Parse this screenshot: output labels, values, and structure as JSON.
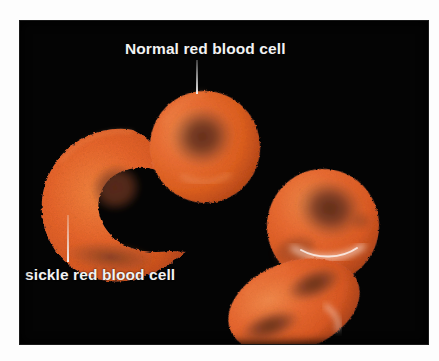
{
  "figure": {
    "kind": "scientific-illustration",
    "background_color": "#040404",
    "page_color": "#fdfdfd",
    "plate": {
      "x": 20,
      "y": 21,
      "width": 408,
      "height": 323
    }
  },
  "palette": {
    "cell_orange": "#E8652B",
    "cell_orange_light": "#F4853F",
    "cell_orange_mid": "#DE5C24",
    "cell_shadow": "#A8401C",
    "cell_center_dark": "#7A3A22",
    "cell_center_darker": "#5E2C1A",
    "highlight_white": "#FFF4EC",
    "label_text": "#F2F2F2",
    "leader_line": "#F0F0F0",
    "background": "#040404"
  },
  "labels": [
    {
      "id": "normal-red-blood-cell",
      "text": "Normal red blood cell",
      "color": "#F2F2F2",
      "x": 125,
      "y": 40,
      "leader": {
        "x": 196,
        "y": 60,
        "height": 34
      }
    },
    {
      "id": "sickle-red-blood-cell",
      "text": "sickle red blood cell",
      "color": "#F2F2F2",
      "x": 25,
      "y": 266,
      "leader": {
        "x": 67,
        "y": 215,
        "height": 47
      }
    }
  ],
  "cells": [
    {
      "id": "normal-cell-top",
      "type": "normal",
      "shape": "biconcave-disc",
      "description": "Normal red blood cell, round biconcave disc with dark central pallor",
      "center_x": 200,
      "center_y": 140,
      "radius": 54
    },
    {
      "id": "sickle-cell-left",
      "type": "sickle",
      "shape": "crescent",
      "description": "Sickled red blood cell, crescent shape with pointed tips opening to the right",
      "center_x": 105,
      "center_y": 195,
      "radius": 70
    },
    {
      "id": "normal-cell-right-back",
      "type": "normal",
      "shape": "biconcave-disc",
      "description": "Normal red blood cell behind, tilted round disc with specular highlight",
      "center_x": 320,
      "center_y": 225,
      "radius": 55
    },
    {
      "id": "normal-cell-right-front",
      "type": "normal",
      "shape": "biconcave-disc-edge",
      "description": "Normal red blood cell in front, foreshortened ellipse seen near edge-on",
      "center_x": 285,
      "center_y": 283,
      "radius": 45
    }
  ]
}
